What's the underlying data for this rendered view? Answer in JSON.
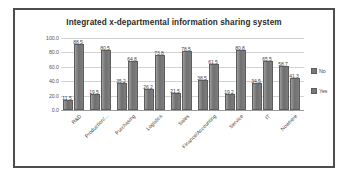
{
  "chart_data": {
    "type": "bar",
    "title": "Integrated x-departmental information sharing system",
    "xlabel": "",
    "ylabel": "",
    "ylim": [
      0.0,
      100.0
    ],
    "yticks": [
      "0.0",
      "20.0",
      "40.0",
      "60.0",
      "80.0",
      "100.0"
    ],
    "grid": true,
    "legend_position": "right",
    "categories": [
      "R&D",
      "Production/...",
      "Purchasing",
      "Logistics",
      "Sales",
      "Finance/Accounting",
      "Service",
      "IT",
      "Nowhere"
    ],
    "series": [
      {
        "name": "Yes",
        "color": "#787878",
        "values": [
          11.5,
          19.5,
          35.2,
          26.2,
          21.5,
          38.5,
          19.2,
          34.5,
          58.7
        ]
      },
      {
        "name": "No",
        "color": "#787878",
        "values": [
          88.5,
          80.5,
          64.8,
          73.8,
          78.5,
          61.5,
          80.8,
          65.5,
          41.3
        ]
      }
    ]
  },
  "legend": {
    "items": [
      {
        "label": "No"
      },
      {
        "label": "Yes"
      }
    ]
  }
}
